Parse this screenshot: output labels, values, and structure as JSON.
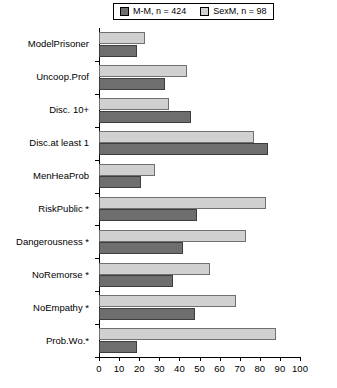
{
  "chart_data": {
    "type": "bar",
    "orientation": "horizontal",
    "title": "",
    "xlabel": "",
    "ylabel": "",
    "xlim": [
      0,
      100
    ],
    "xticks": [
      0,
      10,
      20,
      30,
      40,
      50,
      60,
      70,
      80,
      90,
      100
    ],
    "grid": false,
    "legend_position": "top",
    "categories": [
      "ModelPrisoner",
      "Uncoop.Prof",
      "Disc. 10+",
      "Disc.at least 1",
      "MenHeaProb",
      "RiskPublic *",
      "Dangerousness *",
      "NoRemorse *",
      "NoEmpathy *",
      "Prob.Wo.*"
    ],
    "series": [
      {
        "name": "M-M, n = 424",
        "color": "#6e6e6e",
        "values": [
          19,
          33,
          46,
          84,
          21,
          49,
          42,
          37,
          48,
          19
        ]
      },
      {
        "name": "SexM, n = 98",
        "color": "#d0d0d0",
        "values": [
          23,
          44,
          35,
          77,
          28,
          83,
          73,
          55,
          68,
          88
        ]
      }
    ]
  },
  "legend": {
    "entries": [
      {
        "label": "M-M, n = 424",
        "swatch": "dark-square-icon"
      },
      {
        "label": "SexM, n = 98",
        "swatch": "light-square-icon"
      }
    ]
  }
}
